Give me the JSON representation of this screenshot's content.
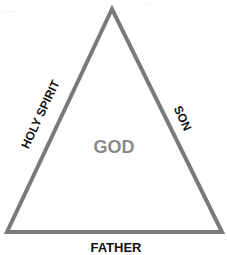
{
  "diagram": {
    "type": "triangle",
    "stroke_color": "#7a7a7a",
    "center_label": "GOD",
    "sides": {
      "left": "HOLY SPIRIT",
      "right": "SON",
      "bottom": "FATHER"
    },
    "faint_text": {
      "top_left": "........ ..",
      "top_right": ". . .. ."
    }
  }
}
